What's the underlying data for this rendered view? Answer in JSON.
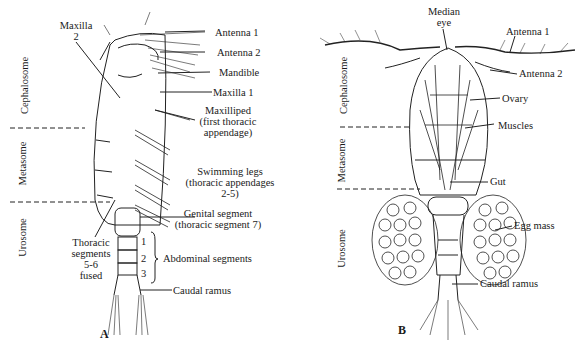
{
  "figure": {
    "panel_a": {
      "letter": "A",
      "regions": [
        "Cephalosome",
        "Metasome",
        "Urosome"
      ],
      "labels": {
        "maxilla2_line1": "Maxilla",
        "maxilla2_line2": "2",
        "antenna1": "Antenna 1",
        "antenna2": "Antenna 2",
        "mandible": "Mandible",
        "maxilla1": "Maxilla 1",
        "maxilliped_l1": "Maxilliped",
        "maxilliped_l2": "(first thoracic",
        "maxilliped_l3": "appendage)",
        "swim_l1": "Swimming legs",
        "swim_l2": "(thoracic appendages",
        "swim_l3": "2-5)",
        "genital_l1": "Genital segment",
        "genital_l2": "(thoracic segment 7)",
        "thoracic_l1": "Thoracic",
        "thoracic_l2": "segments",
        "thoracic_l3": "5-6",
        "thoracic_l4": "fused",
        "abd_1": "1",
        "abd_2": "2",
        "abd_3": "3",
        "abdominal": "Abdominal segments",
        "caudal": "Caudal ramus"
      }
    },
    "panel_b": {
      "letter": "B",
      "regions": [
        "Cephalosome",
        "Metasome",
        "Urosome"
      ],
      "labels": {
        "median_l1": "Median",
        "median_l2": "eye",
        "antenna1": "Antenna 1",
        "antenna2": "Antenna 2",
        "ovary": "Ovary",
        "muscles": "Muscles",
        "gut": "Gut",
        "egg_mass": "Egg mass",
        "caudal": "Caudal ramus"
      }
    }
  }
}
